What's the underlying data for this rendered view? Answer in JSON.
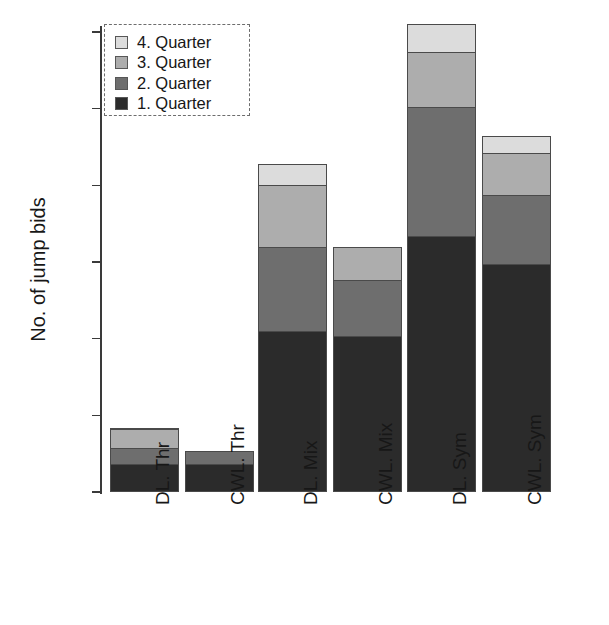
{
  "chart_data": {
    "type": "bar",
    "subtype": "stacked-bar",
    "title": "",
    "xlabel": "",
    "ylabel": "No. of jump bids",
    "ylim": [
      0,
      30.7
    ],
    "yticks": [
      0,
      5,
      10,
      15,
      20,
      25,
      30
    ],
    "ytick_labels": [
      "0",
      "5",
      "10",
      "15",
      "20",
      "25",
      "30"
    ],
    "grid": false,
    "legend_position": "upper-left",
    "categories": [
      "DL. Thr",
      "CWL. Thr",
      "DL. Mix",
      "CWL. Mix",
      "DL. Sym",
      "CWL. Sym"
    ],
    "series": [
      {
        "name": "1. Quarter",
        "color": "#2b2b2b",
        "values": [
          1.8,
          1.8,
          10.5,
          10.2,
          16.7,
          14.9
        ]
      },
      {
        "name": "2. Quarter",
        "color": "#6e6e6e",
        "values": [
          1.1,
          0.9,
          5.5,
          3.6,
          8.4,
          4.5
        ]
      },
      {
        "name": "3. Quarter",
        "color": "#adadad",
        "values": [
          1.2,
          0.0,
          4.0,
          2.2,
          3.6,
          2.7
        ]
      },
      {
        "name": "4. Quarter",
        "color": "#dcdcdc",
        "values": [
          0.1,
          0.0,
          1.4,
          0.0,
          1.8,
          1.1
        ]
      }
    ],
    "totals": [
      4.2,
      2.7,
      21.4,
      16.0,
      30.5,
      23.2
    ]
  },
  "legend": {
    "items": [
      {
        "label": "4. Quarter",
        "color": "#dcdcdc"
      },
      {
        "label": "3. Quarter",
        "color": "#adadad"
      },
      {
        "label": "2. Quarter",
        "color": "#6e6e6e"
      },
      {
        "label": "1. Quarter",
        "color": "#2b2b2b"
      }
    ]
  },
  "axis": {
    "y_title": "No. of jump bids"
  }
}
